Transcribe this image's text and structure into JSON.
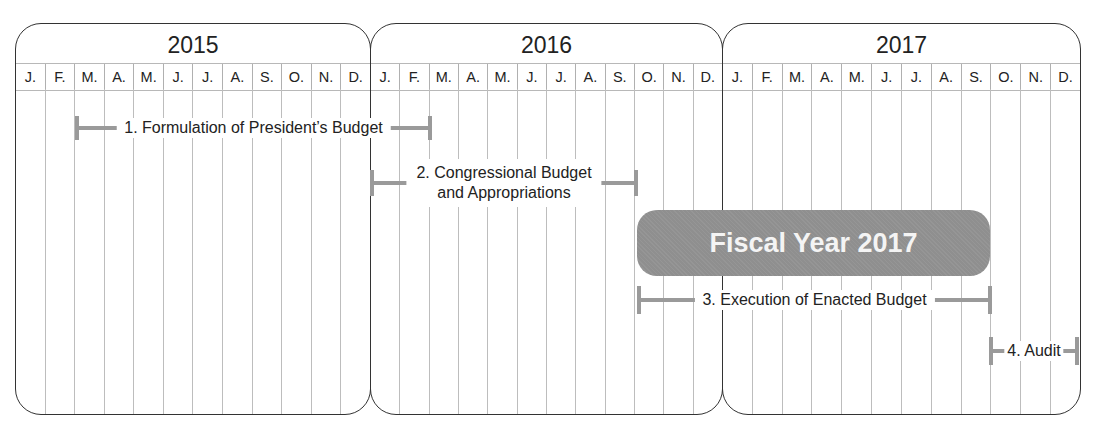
{
  "years": [
    {
      "label": "2015",
      "months": [
        "J.",
        "F.",
        "M.",
        "A.",
        "M.",
        "J.",
        "J.",
        "A.",
        "S.",
        "O.",
        "N.",
        "D."
      ]
    },
    {
      "label": "2016",
      "months": [
        "J.",
        "F.",
        "M.",
        "A.",
        "M.",
        "J.",
        "J.",
        "A.",
        "S.",
        "O.",
        "N.",
        "D."
      ]
    },
    {
      "label": "2017",
      "months": [
        "J.",
        "F.",
        "M.",
        "A.",
        "M.",
        "J.",
        "J.",
        "A.",
        "S.",
        "O.",
        "N.",
        "D."
      ]
    }
  ],
  "phases": [
    {
      "label": "1. Formulation of President’s Budget",
      "start": "2015-03",
      "end": "2016-02"
    },
    {
      "label": "2. Congressional Budget and Appropriations",
      "line1": "2. Congressional Budget",
      "line2": "and Appropriations",
      "start": "2016-01",
      "end": "2016-09"
    },
    {
      "label": "3. Execution of Enacted Budget",
      "start": "2016-10",
      "end": "2017-09"
    },
    {
      "label": "4. Audit",
      "start": "2017-10",
      "end": "2017-12"
    }
  ],
  "fiscal_year": {
    "label": "Fiscal Year 2017",
    "start": "2016-10",
    "end": "2017-09",
    "color": "#8f8f8f"
  },
  "colors": {
    "bar": "#9a9a9a",
    "border": "#333333",
    "grid": "#bdbdbd"
  }
}
